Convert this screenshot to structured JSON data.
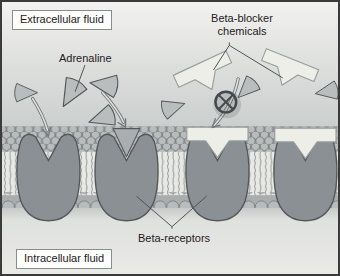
{
  "labels": {
    "extracellular": "Extracellular fluid",
    "adrenaline": "Adrenaline",
    "beta_blocker_line1": "Beta-blocker",
    "beta_blocker_line2": "chemicals",
    "beta_receptors": "Beta-receptors",
    "intracellular": "Intracellular fluid"
  },
  "icons": {
    "blocked_binding": "no-entry-icon",
    "adrenaline_molecule": "wedge-triangle-icon",
    "beta_blocker_molecule": "t-shape-icon",
    "binding_arrow": "curved-arrow-icon"
  },
  "colors": {
    "frame": "#3b3b3b",
    "extracellular_top": "#f2f2f0",
    "extracellular_mid": "#dcdedc",
    "extracellular_bottom": "#c0c4c4",
    "intracellular_top": "#c6c9c8",
    "intracellular_fill": "#eaeae7",
    "membrane_gap": "#989c9d",
    "membrane_band": "#a9adac",
    "head_fill": "#b8bcbd",
    "head_outline": "#787c7e",
    "tail_stroke": "#a0a4a2",
    "tail_bg": "#e8e9e5",
    "receptor_fill": "#8b9094",
    "receptor_outline": "#54585b",
    "adrenaline_fill": "#b9bdbe",
    "adrenaline_bound_fill": "#a9aeb0",
    "adrenaline_outline": "#54585a",
    "blocker_fill": "#edeee8",
    "blocker_outline": "#979c9a",
    "arrow_stroke": "#75797b",
    "arrow_inner": "#dfe1df",
    "prohibition": "#45494b",
    "pointer": "#4f5254",
    "label_text": "#1f2022",
    "label_box_border": "#8a8d8f",
    "label_box_bg": "#fdfdfc"
  }
}
